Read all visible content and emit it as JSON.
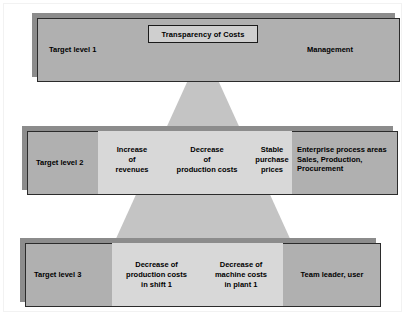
{
  "diagram": {
    "title_box": {
      "label": "Transparency of Costs"
    },
    "levels": [
      {
        "id": "level-1",
        "left_label": "Target level 1",
        "right_label": "Management",
        "cells": []
      },
      {
        "id": "level-2",
        "left_label": "Target level 2",
        "right_label": "Enterprise process areas\nSales, Production,\nProcurement",
        "cells": [
          {
            "label": "Increase\nof\nrevenues"
          },
          {
            "label": "Decrease\nof\nproduction costs"
          },
          {
            "label": "Stable\npurchase\nprices"
          }
        ]
      },
      {
        "id": "level-3",
        "left_label": "Target level 3",
        "right_label": "Team leader, user",
        "cells": [
          {
            "label": "Decrease of\nproduction costs\nin shift 1"
          },
          {
            "label": "Decrease of\nmachine costs\nin plant 1"
          }
        ]
      }
    ],
    "colors": {
      "page_background": "#ffffff",
      "bar_fill": "#b0b0b0",
      "bar_border": "#2b2b2b",
      "bar_shadow": "#8c8c8c",
      "pyramid_fill": "#c4c4c4",
      "panel_fill": "#d8d8d8",
      "title_box_fill": "#cfcfcf",
      "title_box_border": "#1a1a1a",
      "text": "#000000"
    }
  }
}
